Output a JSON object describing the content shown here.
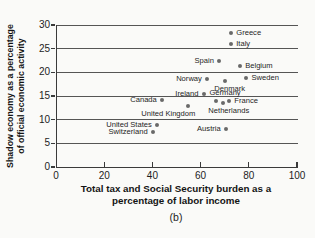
{
  "figure_label": "(b)",
  "colors": {
    "background": "#fafaf8",
    "dot": "#696969",
    "grid": "#555555",
    "axis": "#3a3a3a",
    "text": "#1d1d1d"
  },
  "chart_data": {
    "type": "scatter",
    "title": "",
    "xlabel": "Total tax and Social Security burden as a percentage of labor income",
    "ylabel": "Shadow economy as a percentage of official economic activity",
    "xlabel_lines": [
      "Total tax and Social Security burden as a",
      "percentage of labor income"
    ],
    "ylabel_lines": [
      "Shadow economy as a percentage",
      "of official economic activity"
    ],
    "xlim": [
      0,
      100
    ],
    "ylim": [
      0,
      30
    ],
    "x_ticks": [
      0,
      20,
      40,
      60,
      80,
      100
    ],
    "y_ticks": [
      0,
      5,
      10,
      15,
      20,
      25,
      30
    ],
    "grid": "horizontal",
    "legend": "none",
    "points": [
      {
        "country": "Greece",
        "x": 72.3,
        "y": 28.4,
        "label_pos": "right"
      },
      {
        "country": "Italy",
        "x": 72.3,
        "y": 26.0,
        "label_pos": "right"
      },
      {
        "country": "Spain",
        "x": 67.2,
        "y": 22.4,
        "label_pos": "left"
      },
      {
        "country": "Belgium",
        "x": 76.0,
        "y": 21.4,
        "label_pos": "right"
      },
      {
        "country": "Norway",
        "x": 62.2,
        "y": 18.6,
        "label_pos": "left"
      },
      {
        "country": "Sweden",
        "x": 78.6,
        "y": 18.8,
        "label_pos": "right"
      },
      {
        "country": "Denmark",
        "x": 69.6,
        "y": 18.1,
        "label_pos": "below",
        "dx": 5
      },
      {
        "country": "Ireland",
        "x": 60.8,
        "y": 15.4,
        "label_pos": "left"
      },
      {
        "country": "Canada",
        "x": 43.5,
        "y": 14.2,
        "label_pos": "left"
      },
      {
        "country": "Germany",
        "x": 66.0,
        "y": 13.9,
        "label_pos": "above",
        "dx": 9
      },
      {
        "country": "Netherlands",
        "x": 68.8,
        "y": 13.5,
        "label_pos": "below",
        "dx": 6
      },
      {
        "country": "France",
        "x": 71.5,
        "y": 13.9,
        "label_pos": "right"
      },
      {
        "country": "United Kingdom",
        "x": 54.5,
        "y": 12.8,
        "label_pos": "below",
        "dx": -20
      },
      {
        "country": "United States",
        "x": 41.4,
        "y": 8.8,
        "label_pos": "left"
      },
      {
        "country": "Austria",
        "x": 70.0,
        "y": 8.1,
        "label_pos": "left"
      },
      {
        "country": "Switzerland",
        "x": 39.7,
        "y": 7.5,
        "label_pos": "left"
      }
    ]
  }
}
